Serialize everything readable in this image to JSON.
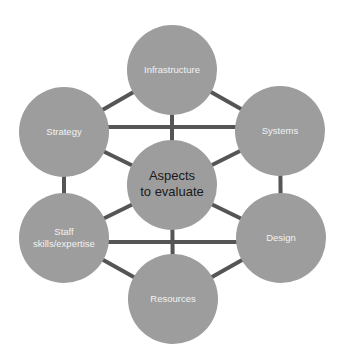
{
  "diagram": {
    "colors": {
      "background": "#ffffff",
      "node_fill": "#9d9d9d",
      "edge": "#555555",
      "outer_text": "#f2f2f2",
      "center_text": "#1a1a1a"
    },
    "center": {
      "id": "center",
      "lines": [
        "Aspects",
        "to evaluate"
      ],
      "x": 172,
      "y": 185,
      "r": 45
    },
    "nodes": [
      {
        "id": "infrastructure",
        "lines": [
          "Infrastructure"
        ],
        "x": 172,
        "y": 70,
        "r": 45
      },
      {
        "id": "strategy",
        "lines": [
          "Strategy"
        ],
        "x": 64,
        "y": 132,
        "r": 45
      },
      {
        "id": "systems",
        "lines": [
          "Systems"
        ],
        "x": 280,
        "y": 131,
        "r": 45
      },
      {
        "id": "staff",
        "lines": [
          "Staff",
          "skills/expertise"
        ],
        "x": 64,
        "y": 238,
        "r": 45
      },
      {
        "id": "design",
        "lines": [
          "Design"
        ],
        "x": 281,
        "y": 238,
        "r": 45
      },
      {
        "id": "resources",
        "lines": [
          "Resources"
        ],
        "x": 173,
        "y": 299,
        "r": 45
      }
    ],
    "edges": [
      {
        "from": "infrastructure",
        "to": "strategy"
      },
      {
        "from": "infrastructure",
        "to": "systems"
      },
      {
        "from": "infrastructure",
        "to": "center"
      },
      {
        "from": "strategy",
        "to": "systems",
        "y": 127
      },
      {
        "from": "strategy",
        "to": "center"
      },
      {
        "from": "systems",
        "to": "center"
      },
      {
        "from": "strategy",
        "to": "staff"
      },
      {
        "from": "systems",
        "to": "design"
      },
      {
        "from": "staff",
        "to": "center"
      },
      {
        "from": "design",
        "to": "center"
      },
      {
        "from": "staff",
        "to": "design",
        "y": 242
      },
      {
        "from": "center",
        "to": "resources"
      },
      {
        "from": "staff",
        "to": "resources"
      },
      {
        "from": "design",
        "to": "resources"
      }
    ]
  }
}
